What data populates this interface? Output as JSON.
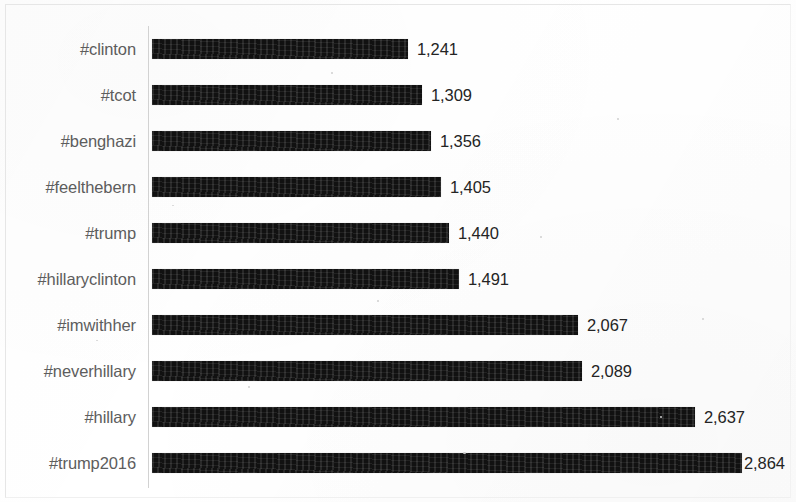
{
  "chart_data": {
    "type": "bar",
    "orientation": "horizontal",
    "title": "",
    "subtitle": "",
    "xlabel": "",
    "ylabel": "",
    "grid": false,
    "legend": false,
    "legend_position": "none",
    "xlim": [
      0,
      2864
    ],
    "value_label_format": "comma-separated integer",
    "categories": [
      "#clinton",
      "#tcot",
      "#benghazi",
      "#feelthebern",
      "#trump",
      "#hillaryclinton",
      "#imwithher",
      "#neverhillary",
      "#hillary",
      "#trump2016"
    ],
    "values": [
      1241,
      1309,
      1356,
      1405,
      1440,
      1491,
      2067,
      2089,
      2637,
      2864
    ],
    "value_labels": [
      "1,241",
      "1,309",
      "1,356",
      "1,405",
      "1,440",
      "1,491",
      "2,067",
      "2,089",
      "2,637",
      "2,864"
    ],
    "bars": [
      {
        "category": "#clinton",
        "value": 1241,
        "label": "1,241"
      },
      {
        "category": "#tcot",
        "value": 1309,
        "label": "1,309"
      },
      {
        "category": "#benghazi",
        "value": 1356,
        "label": "1,356"
      },
      {
        "category": "#feelthebern",
        "value": 1405,
        "label": "1,405"
      },
      {
        "category": "#trump",
        "value": 1440,
        "label": "1,440"
      },
      {
        "category": "#hillaryclinton",
        "value": 1491,
        "label": "1,491"
      },
      {
        "category": "#imwithher",
        "value": 2067,
        "label": "2,067"
      },
      {
        "category": "#neverhillary",
        "value": 2089,
        "label": "2,089"
      },
      {
        "category": "#hillary",
        "value": 2637,
        "label": "2,637"
      },
      {
        "category": "#trump2016",
        "value": 2864,
        "label": "2,864"
      }
    ],
    "colors": {
      "bar": "#111111",
      "category_label": "#5d5d5d",
      "value_label": "#242424",
      "axis_line": "#d2d2d2",
      "background": "#ffffff"
    }
  }
}
